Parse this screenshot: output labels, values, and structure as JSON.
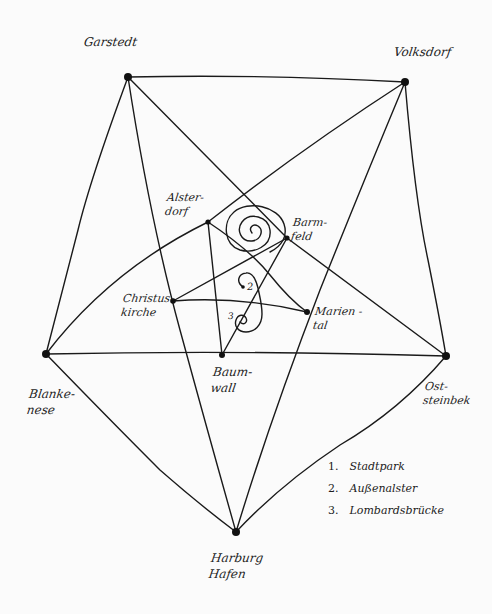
{
  "diagram": {
    "type": "hand-drawn network graph",
    "background": "#fbfbfb",
    "ink_color": "#1a1a1a",
    "nodes": [
      {
        "id": "garstedt",
        "label": "Garstedt",
        "x": 128,
        "y": 77
      },
      {
        "id": "volksdorf",
        "label": "Volksdorf",
        "x": 405,
        "y": 82
      },
      {
        "id": "blankenese",
        "label": "Blanke-\nnese",
        "x": 46,
        "y": 354
      },
      {
        "id": "oststeinbek",
        "label": "Ost-\nsteinbek",
        "x": 446,
        "y": 356
      },
      {
        "id": "harburg",
        "label": "Harburg\nHafen",
        "x": 236,
        "y": 532
      },
      {
        "id": "alsterdorf",
        "label": "Alster-\ndorf",
        "x": 208,
        "y": 222
      },
      {
        "id": "barmbek",
        "label": "Barm-\nfeld",
        "x": 287,
        "y": 238
      },
      {
        "id": "christuskirche",
        "label": "Christus-\nkirche",
        "x": 173,
        "y": 301
      },
      {
        "id": "mariental",
        "label": "Marien -\ntal",
        "x": 307,
        "y": 312
      },
      {
        "id": "baumwall",
        "label": "Baum-\nwall",
        "x": 222,
        "y": 355
      }
    ],
    "legend": [
      {
        "number": "1.",
        "text": "Stadtpark"
      },
      {
        "number": "2.",
        "text": "Außenalster"
      },
      {
        "number": "3.",
        "text": "Lombardsbrücke"
      }
    ],
    "inline_markers": [
      {
        "text": "2",
        "x": 245,
        "y": 287
      },
      {
        "text": "3",
        "x": 230,
        "y": 316
      }
    ]
  }
}
